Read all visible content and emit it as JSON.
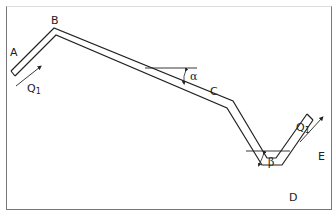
{
  "diagram": {
    "points": {
      "A": "A",
      "B": "B",
      "C": "C",
      "D": "D",
      "E": "E"
    },
    "flow_in": {
      "label": "Q",
      "subscript": "1"
    },
    "flow_out": {
      "label": "Q",
      "subscript": "1"
    },
    "angles": {
      "alpha": "α",
      "beta": "β"
    },
    "colors": {
      "stroke": "#222222",
      "frame": "#777777"
    }
  }
}
